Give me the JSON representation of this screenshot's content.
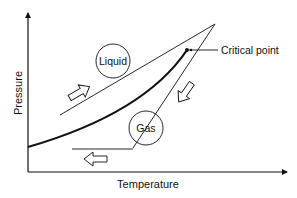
{
  "diagram": {
    "type": "phase-diagram",
    "axes": {
      "x_label": "Temperature",
      "y_label": "Pressure"
    },
    "regions": [
      {
        "id": "liquid",
        "label": "Liquid"
      },
      {
        "id": "gas",
        "label": "Gas"
      }
    ],
    "annotations": [
      {
        "id": "critical-point",
        "label": "Critical point"
      }
    ],
    "arrows": [
      {
        "id": "arrow-compress-liquid",
        "direction": "up-right"
      },
      {
        "id": "arrow-cool",
        "direction": "down-left"
      },
      {
        "id": "arrow-expand-gas",
        "direction": "left"
      }
    ],
    "colors": {
      "line": "#111111",
      "background": "#ffffff"
    }
  }
}
